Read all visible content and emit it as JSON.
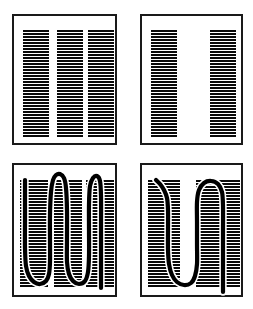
{
  "figure": {
    "title": "",
    "background_color": "#ffffff",
    "ink_color": "#0a0a0a",
    "panel_border_color": "#1a1a1a",
    "panel_border_width": 2,
    "width": 253,
    "height": 309,
    "layout": "2x2 grid of bordered panels",
    "hatch": {
      "orientation": "horizontal",
      "line_color": "#0a0a0a",
      "line_thickness": 1.5,
      "period": 3.0,
      "description": "dense horizontal ruling forming vertical bands"
    },
    "curve": {
      "color": "#000000",
      "stroke_width": 4.2,
      "style": "thick hand-drawn serpentine stroke"
    }
  },
  "panels": [
    {
      "id": "panel-top-left",
      "name": "three-band-hatch-panel",
      "position": "top-left",
      "x": 12,
      "y": 14,
      "w": 105,
      "h": 131,
      "has_curve": false,
      "band_count": 3,
      "bands": [
        {
          "x": 23,
          "w": 26,
          "y": 31,
          "h": 105
        },
        {
          "x": 57,
          "w": 26,
          "y": 31,
          "h": 105
        },
        {
          "x": 88,
          "w": 26,
          "y": 31,
          "h": 105
        }
      ]
    },
    {
      "id": "panel-top-right",
      "name": "two-band-hatch-panel",
      "position": "top-right",
      "x": 140,
      "y": 14,
      "w": 103,
      "h": 131,
      "has_curve": false,
      "band_count": 2,
      "bands": [
        {
          "x": 151,
          "w": 26,
          "y": 31,
          "h": 105
        },
        {
          "x": 210,
          "w": 26,
          "y": 31,
          "h": 105
        }
      ]
    },
    {
      "id": "panel-bottom-left",
      "name": "three-band-hatch-with-zigzag-curve-panel",
      "position": "bottom-left",
      "x": 12,
      "y": 163,
      "w": 105,
      "h": 134,
      "has_curve": true,
      "band_count": 3,
      "bands": [
        {
          "x": 20,
          "w": 28,
          "y": 181,
          "h": 105
        },
        {
          "x": 54,
          "w": 28,
          "y": 181,
          "h": 105
        },
        {
          "x": 86,
          "w": 28,
          "y": 181,
          "h": 105
        }
      ],
      "curve_points": [
        [
          25,
          180
        ],
        [
          25,
          196
        ],
        [
          25,
          220
        ],
        [
          25,
          248
        ],
        [
          26,
          266
        ],
        [
          29,
          276
        ],
        [
          34,
          282
        ],
        [
          40,
          284
        ],
        [
          46,
          281
        ],
        [
          49,
          274
        ],
        [
          50,
          262
        ],
        [
          50,
          240
        ],
        [
          50,
          214
        ],
        [
          51,
          192
        ],
        [
          53,
          180
        ],
        [
          56,
          175
        ],
        [
          60,
          174
        ],
        [
          64,
          178
        ],
        [
          66,
          188
        ],
        [
          67,
          210
        ],
        [
          67,
          238
        ],
        [
          67,
          262
        ],
        [
          69,
          274
        ],
        [
          73,
          281
        ],
        [
          79,
          284
        ],
        [
          85,
          281
        ],
        [
          88,
          272
        ],
        [
          89,
          256
        ],
        [
          89,
          230
        ],
        [
          89,
          204
        ],
        [
          90,
          186
        ],
        [
          93,
          178
        ],
        [
          97,
          176
        ],
        [
          100,
          181
        ],
        [
          101,
          196
        ],
        [
          101,
          230
        ],
        [
          101,
          262
        ],
        [
          101,
          288
        ]
      ]
    },
    {
      "id": "panel-bottom-right",
      "name": "two-band-hatch-with-u-curve-panel",
      "position": "bottom-right",
      "x": 140,
      "y": 163,
      "w": 103,
      "h": 134,
      "has_curve": true,
      "band_count": 2,
      "bands": [
        {
          "x": 148,
          "w": 32,
          "y": 181,
          "h": 105
        },
        {
          "x": 196,
          "w": 44,
          "y": 181,
          "h": 105
        }
      ],
      "curve_points": [
        [
          156,
          180
        ],
        [
          160,
          184
        ],
        [
          164,
          190
        ],
        [
          167,
          198
        ],
        [
          168,
          210
        ],
        [
          168,
          230
        ],
        [
          168,
          250
        ],
        [
          169,
          264
        ],
        [
          172,
          275
        ],
        [
          177,
          282
        ],
        [
          184,
          285
        ],
        [
          191,
          283
        ],
        [
          195,
          276
        ],
        [
          197,
          264
        ],
        [
          197,
          244
        ],
        [
          197,
          222
        ],
        [
          197,
          202
        ],
        [
          199,
          190
        ],
        [
          204,
          183
        ],
        [
          211,
          181
        ],
        [
          218,
          184
        ],
        [
          222,
          192
        ],
        [
          223,
          206
        ],
        [
          223,
          230
        ],
        [
          223,
          254
        ],
        [
          223,
          276
        ],
        [
          223,
          292
        ]
      ]
    }
  ]
}
